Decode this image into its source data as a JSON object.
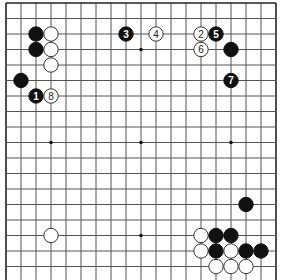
{
  "board": {
    "columns": 19,
    "visible_rows": 18,
    "top_edge": true,
    "left_edge": true,
    "right_edge": true,
    "bottom_edge": false,
    "colors": {
      "black": "#111111",
      "white": "#ffffff",
      "grid": "#555555"
    }
  },
  "star_points": [
    {
      "col": 9,
      "row": 3
    },
    {
      "col": 3,
      "row": 9
    },
    {
      "col": 9,
      "row": 9
    },
    {
      "col": 15,
      "row": 9
    },
    {
      "col": 9,
      "row": 15
    }
  ],
  "stones": [
    {
      "color": "black",
      "col": 2,
      "row": 2,
      "label": ""
    },
    {
      "color": "black",
      "col": 2,
      "row": 3,
      "label": ""
    },
    {
      "color": "white",
      "col": 3,
      "row": 2,
      "label": ""
    },
    {
      "color": "white",
      "col": 3,
      "row": 3,
      "label": ""
    },
    {
      "color": "white",
      "col": 3,
      "row": 4,
      "label": ""
    },
    {
      "color": "black",
      "col": 1,
      "row": 5,
      "label": ""
    },
    {
      "color": "black",
      "col": 2,
      "row": 6,
      "label": "1"
    },
    {
      "color": "white",
      "col": 3,
      "row": 6,
      "label": "8"
    },
    {
      "color": "black",
      "col": 8,
      "row": 2,
      "label": "3"
    },
    {
      "color": "white",
      "col": 10,
      "row": 2,
      "label": "4"
    },
    {
      "color": "white",
      "col": 13,
      "row": 2,
      "label": "2"
    },
    {
      "color": "black",
      "col": 14,
      "row": 2,
      "label": "5"
    },
    {
      "color": "white",
      "col": 13,
      "row": 3,
      "label": "6"
    },
    {
      "color": "black",
      "col": 15,
      "row": 3,
      "label": ""
    },
    {
      "color": "black",
      "col": 15,
      "row": 5,
      "label": "7"
    },
    {
      "color": "white",
      "col": 3,
      "row": 15,
      "label": ""
    },
    {
      "color": "black",
      "col": 16,
      "row": 13,
      "label": ""
    },
    {
      "color": "white",
      "col": 13,
      "row": 15,
      "label": ""
    },
    {
      "color": "black",
      "col": 14,
      "row": 15,
      "label": ""
    },
    {
      "color": "black",
      "col": 15,
      "row": 15,
      "label": ""
    },
    {
      "color": "white",
      "col": 13,
      "row": 16,
      "label": ""
    },
    {
      "color": "black",
      "col": 14,
      "row": 16,
      "label": ""
    },
    {
      "color": "white",
      "col": 15,
      "row": 16,
      "label": ""
    },
    {
      "color": "black",
      "col": 16,
      "row": 16,
      "label": ""
    },
    {
      "color": "black",
      "col": 17,
      "row": 16,
      "label": ""
    },
    {
      "color": "white",
      "col": 14,
      "row": 17,
      "label": ""
    },
    {
      "color": "white",
      "col": 15,
      "row": 17,
      "label": ""
    },
    {
      "color": "white",
      "col": 16,
      "row": 17,
      "label": ""
    }
  ]
}
